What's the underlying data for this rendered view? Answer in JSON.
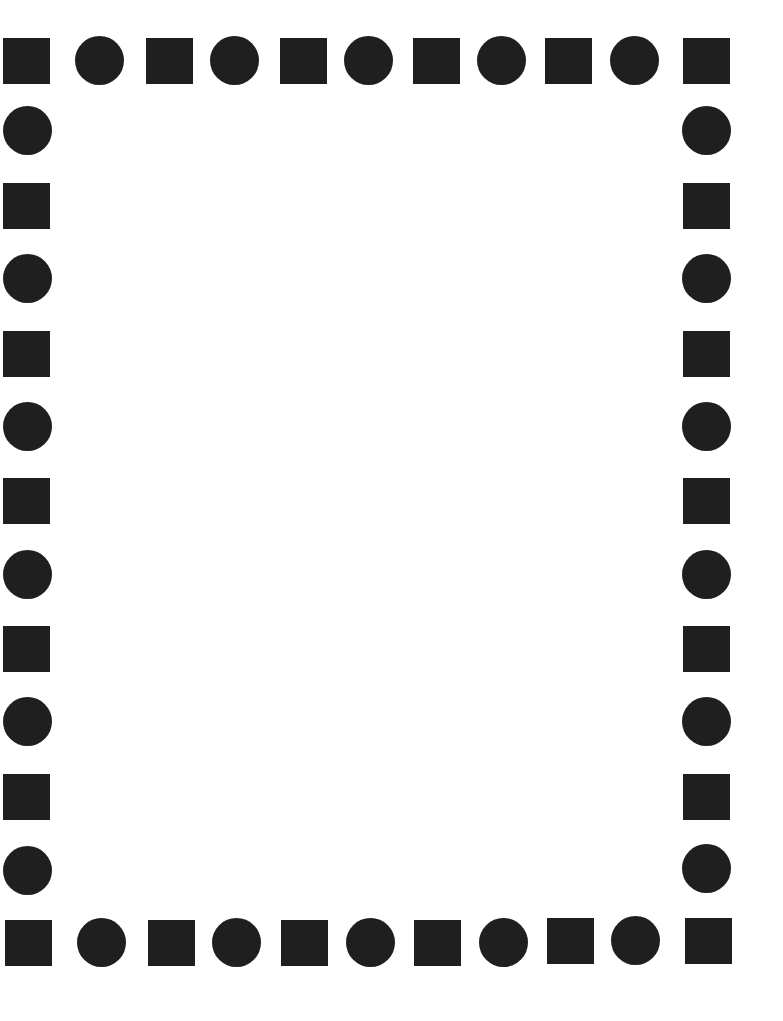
{
  "page": {
    "color": "#1f1f1f",
    "background": "#ffffff"
  },
  "border": {
    "top": [
      {
        "shape": "square",
        "x": 3,
        "y": 38
      },
      {
        "shape": "circle",
        "x": 75,
        "y": 36
      },
      {
        "shape": "square",
        "x": 146,
        "y": 38
      },
      {
        "shape": "circle",
        "x": 210,
        "y": 36
      },
      {
        "shape": "square",
        "x": 280,
        "y": 38
      },
      {
        "shape": "circle",
        "x": 344,
        "y": 36
      },
      {
        "shape": "square",
        "x": 413,
        "y": 38
      },
      {
        "shape": "circle",
        "x": 477,
        "y": 36
      },
      {
        "shape": "square",
        "x": 545,
        "y": 38
      },
      {
        "shape": "circle",
        "x": 610,
        "y": 36
      },
      {
        "shape": "square",
        "x": 683,
        "y": 38
      }
    ],
    "left": [
      {
        "shape": "circle",
        "x": 3,
        "y": 106
      },
      {
        "shape": "square",
        "x": 3,
        "y": 183
      },
      {
        "shape": "circle",
        "x": 3,
        "y": 254
      },
      {
        "shape": "square",
        "x": 3,
        "y": 331
      },
      {
        "shape": "circle",
        "x": 3,
        "y": 402
      },
      {
        "shape": "square",
        "x": 3,
        "y": 478
      },
      {
        "shape": "circle",
        "x": 3,
        "y": 550
      },
      {
        "shape": "square",
        "x": 3,
        "y": 626
      },
      {
        "shape": "circle",
        "x": 3,
        "y": 697
      },
      {
        "shape": "square",
        "x": 3,
        "y": 774
      },
      {
        "shape": "circle",
        "x": 3,
        "y": 846
      }
    ],
    "right": [
      {
        "shape": "circle",
        "x": 682,
        "y": 106
      },
      {
        "shape": "square",
        "x": 683,
        "y": 183
      },
      {
        "shape": "circle",
        "x": 682,
        "y": 254
      },
      {
        "shape": "square",
        "x": 683,
        "y": 331
      },
      {
        "shape": "circle",
        "x": 682,
        "y": 402
      },
      {
        "shape": "square",
        "x": 683,
        "y": 478
      },
      {
        "shape": "circle",
        "x": 682,
        "y": 550
      },
      {
        "shape": "square",
        "x": 683,
        "y": 626
      },
      {
        "shape": "circle",
        "x": 682,
        "y": 697
      },
      {
        "shape": "square",
        "x": 683,
        "y": 774
      },
      {
        "shape": "circle",
        "x": 682,
        "y": 844
      }
    ],
    "bottom": [
      {
        "shape": "square",
        "x": 5,
        "y": 920
      },
      {
        "shape": "circle",
        "x": 77,
        "y": 918
      },
      {
        "shape": "square",
        "x": 148,
        "y": 920
      },
      {
        "shape": "circle",
        "x": 212,
        "y": 918
      },
      {
        "shape": "square",
        "x": 281,
        "y": 920
      },
      {
        "shape": "circle",
        "x": 346,
        "y": 918
      },
      {
        "shape": "square",
        "x": 414,
        "y": 920
      },
      {
        "shape": "circle",
        "x": 479,
        "y": 918
      },
      {
        "shape": "square",
        "x": 547,
        "y": 918
      },
      {
        "shape": "circle",
        "x": 611,
        "y": 916
      },
      {
        "shape": "square",
        "x": 685,
        "y": 918
      }
    ]
  }
}
